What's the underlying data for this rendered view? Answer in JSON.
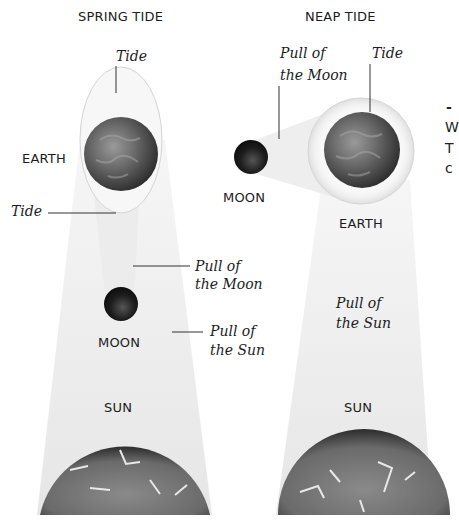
{
  "panels": {
    "spring": {
      "title": "SPRING TIDE",
      "labels": {
        "tide_top": "Tide",
        "tide_bottom": "Tide",
        "earth": "EARTH",
        "moon": "MOON",
        "sun": "SUN",
        "pull_moon_line1": "Pull of",
        "pull_moon_line2": "the Moon",
        "pull_sun_line1": "Pull of",
        "pull_sun_line2": "the Sun"
      }
    },
    "neap": {
      "title": "NEAP TIDE",
      "labels": {
        "tide": "Tide",
        "earth": "EARTH",
        "moon": "MOON",
        "sun": "SUN",
        "pull_moon_line1": "Pull of",
        "pull_moon_line2": "the Moon",
        "pull_sun_line1": "Pull of",
        "pull_sun_line2": "the Sun"
      }
    }
  },
  "side_text_fragments": [
    "-",
    "W",
    "T",
    "c"
  ],
  "colors": {
    "beam": "#efefef",
    "tide_bulge": "#f3f3f3",
    "earth": "#5a5a5a",
    "moon": "#1a1a1a",
    "sun": "#6e6e6e",
    "leader_line": "#333333"
  }
}
